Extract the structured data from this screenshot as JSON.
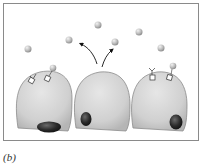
{
  "figure": {
    "panel_label": "(b)",
    "type": "cell-signaling-illustration",
    "colors": {
      "frame": "#8a8a8a",
      "cell_fill": "#d2d2d2",
      "cell_edge": "#8c8c8c",
      "nucleus": "#2a2a2a",
      "molecule": "#bdbdbd",
      "arrow": "#111111",
      "receptor": "#ffffff"
    },
    "cells": [
      {
        "id": "left",
        "role": "target-cell",
        "receptors": 2
      },
      {
        "id": "middle",
        "role": "secreting-cell",
        "receptors": 0
      },
      {
        "id": "right",
        "role": "target-cell",
        "receptors": 2
      }
    ],
    "molecules_count": 10
  }
}
